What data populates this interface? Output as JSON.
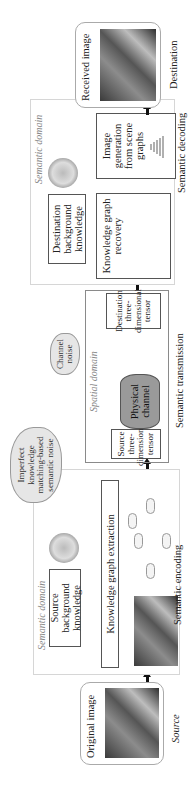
{
  "source": {
    "box_title": "Original image",
    "label": "Source"
  },
  "encoding": {
    "domain_label": "Semantic domain",
    "bg_knowledge": "Source background knowledge",
    "kg_extraction": "Knowledge graph extraction",
    "stage_label": "Semantic encoding"
  },
  "transmission": {
    "domain_label": "Spatial domain",
    "source_tensor": "Source three-dimensional tensor",
    "physical_channel": "Physical channel",
    "dest_tensor": "Destination three-dimensional tensor",
    "stage_label": "Semantic transmission",
    "channel_noise": "Channel noise"
  },
  "semantic_noise": "Imperfect knowledge matching-based semantic noise",
  "decoding": {
    "domain_label": "Semantic domain",
    "bg_knowledge": "Destination background knowledge",
    "kg_recovery": "Knowledge graph recovery",
    "image_generation": "Image generation from scene graphs",
    "stage_label": "Semantic decoding"
  },
  "destination": {
    "box_title": "Received image",
    "label": "Destination"
  }
}
